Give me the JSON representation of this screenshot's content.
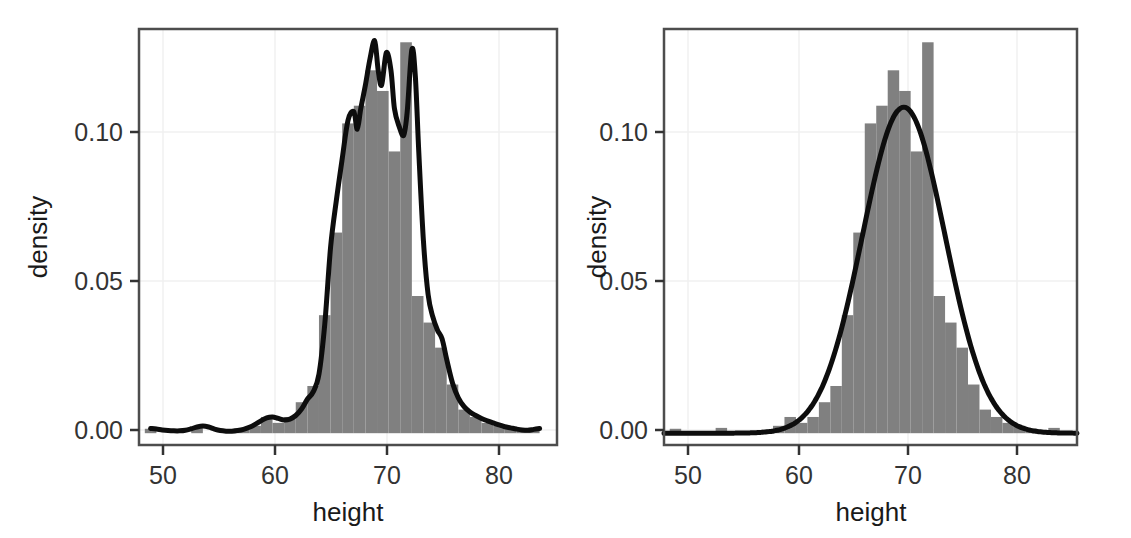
{
  "figure": {
    "panel_count": 2,
    "background": "#ffffff",
    "bar_color": "#808080",
    "curve_color": "#000000",
    "grid_color": "#f2f2f2",
    "border_color": "#4d4d4d",
    "text_color": "#1a1a1a"
  },
  "chart_data": [
    {
      "id": "left-panel",
      "type": "histogram-with-density",
      "title": "",
      "xlabel": "height",
      "ylabel": "density",
      "xlim": [
        48.5,
        84.5
      ],
      "ylim": [
        -0.004,
        0.137
      ],
      "xticks": [
        50,
        60,
        70,
        80
      ],
      "xticklabels": [
        "50",
        "60",
        "70",
        "80"
      ],
      "yticks": [
        0.0,
        0.05,
        0.1
      ],
      "yticklabels": [
        "0.00",
        "0.05",
        "0.10"
      ],
      "grid": true,
      "legend": "none",
      "annotation": "kernel density estimate overlaid on histogram; multimodal, bandwidth small",
      "bin_width": 1,
      "bins_x": [
        49.5,
        50.5,
        51.5,
        52.5,
        53.5,
        54.5,
        55.5,
        56.5,
        57.5,
        58.5,
        59.5,
        60.5,
        61.5,
        62.5,
        63.5,
        64.5,
        65.5,
        66.5,
        67.5,
        68.5,
        69.5,
        70.5,
        71.5,
        72.5,
        73.5,
        74.5,
        75.5,
        76.5,
        77.5,
        78.5,
        79.5,
        80.5,
        81.5,
        82.5
      ],
      "bin_values": [
        0.0015,
        0.0,
        0.0,
        0.0,
        0.0018,
        0.0,
        0.0,
        0.0,
        0.0012,
        0.0025,
        0.0055,
        0.0035,
        0.0055,
        0.0105,
        0.016,
        0.04,
        0.068,
        0.105,
        0.111,
        0.123,
        0.116,
        0.0955,
        0.1325,
        0.0465,
        0.0375,
        0.029,
        0.0165,
        0.008,
        0.0055,
        0.0035,
        0.0025,
        0.0015,
        0.001,
        0.0018
      ],
      "density_x": [
        49.5,
        50.0,
        50.5,
        51.0,
        51.5,
        52.0,
        52.5,
        53.0,
        53.5,
        54.0,
        54.5,
        55.0,
        55.5,
        56.0,
        56.5,
        57.0,
        57.5,
        58.0,
        58.5,
        59.0,
        59.5,
        60.0,
        60.5,
        61.0,
        61.5,
        62.0,
        62.5,
        63.0,
        63.5,
        64.0,
        64.5,
        65.0,
        65.5,
        66.0,
        66.5,
        67.0,
        67.3,
        67.6,
        68.0,
        68.4,
        68.8,
        69.1,
        69.4,
        69.8,
        70.2,
        70.5,
        70.9,
        71.3,
        71.6,
        72.0,
        72.3,
        72.6,
        73.0,
        73.4,
        73.8,
        74.2,
        74.6,
        75.0,
        75.5,
        76.0,
        76.5,
        77.0,
        77.5,
        78.0,
        78.5,
        79.0,
        79.5,
        80.0,
        80.5,
        81.0,
        81.5,
        82.0,
        82.5,
        83.0
      ],
      "density_y": [
        0.0016,
        0.0014,
        0.0011,
        0.0009,
        0.0008,
        0.0008,
        0.001,
        0.0015,
        0.0021,
        0.0024,
        0.0021,
        0.0014,
        0.0009,
        0.0007,
        0.0007,
        0.0009,
        0.0013,
        0.002,
        0.003,
        0.0042,
        0.0052,
        0.0055,
        0.005,
        0.0045,
        0.0048,
        0.006,
        0.0082,
        0.0115,
        0.014,
        0.02,
        0.037,
        0.063,
        0.079,
        0.093,
        0.106,
        0.109,
        0.103,
        0.11,
        0.118,
        0.127,
        0.133,
        0.123,
        0.118,
        0.129,
        0.123,
        0.11,
        0.104,
        0.101,
        0.109,
        0.13,
        0.121,
        0.095,
        0.065,
        0.047,
        0.0395,
        0.035,
        0.032,
        0.025,
        0.017,
        0.012,
        0.009,
        0.0072,
        0.006,
        0.005,
        0.0042,
        0.0035,
        0.0028,
        0.0022,
        0.0018,
        0.0014,
        0.0011,
        0.001,
        0.0013,
        0.0016
      ]
    },
    {
      "id": "right-panel",
      "type": "histogram-with-normal-fit",
      "title": "",
      "xlabel": "height",
      "ylabel": "density",
      "xlim": [
        48.5,
        84.5
      ],
      "ylim": [
        -0.004,
        0.137
      ],
      "xticks": [
        50,
        60,
        70,
        80
      ],
      "xticklabels": [
        "50",
        "60",
        "70",
        "80"
      ],
      "yticks": [
        0.0,
        0.05,
        0.1
      ],
      "yticklabels": [
        "0.00",
        "0.05",
        "0.10"
      ],
      "grid": true,
      "legend": "none",
      "annotation": "fitted normal density overlaid on histogram; unimodal smooth bell curve",
      "bin_width": 1,
      "bins_x": [
        49.5,
        50.5,
        51.5,
        52.5,
        53.5,
        54.5,
        55.5,
        56.5,
        57.5,
        58.5,
        59.5,
        60.5,
        61.5,
        62.5,
        63.5,
        64.5,
        65.5,
        66.5,
        67.5,
        68.5,
        69.5,
        70.5,
        71.5,
        72.5,
        73.5,
        74.5,
        75.5,
        76.5,
        77.5,
        78.5,
        79.5,
        80.5,
        81.5,
        82.5
      ],
      "bin_values": [
        0.0015,
        0.0,
        0.0,
        0.0,
        0.0018,
        0.0,
        0.0,
        0.0,
        0.0012,
        0.0025,
        0.0055,
        0.0035,
        0.0055,
        0.0105,
        0.016,
        0.04,
        0.068,
        0.105,
        0.111,
        0.123,
        0.116,
        0.0955,
        0.1325,
        0.0465,
        0.0375,
        0.029,
        0.0165,
        0.008,
        0.0055,
        0.0035,
        0.0025,
        0.0015,
        0.001,
        0.0018
      ],
      "normal_fit": {
        "mean": 69.4,
        "sd": 3.6,
        "peak": 0.1105
      }
    }
  ],
  "left_panel": {
    "xlabel": "height",
    "ylabel": "density",
    "xticklabels": [
      "50",
      "60",
      "70",
      "80"
    ],
    "yticklabels": [
      "0.00",
      "0.05",
      "0.10"
    ]
  },
  "right_panel": {
    "xlabel": "height",
    "ylabel": "density",
    "xticklabels": [
      "50",
      "60",
      "70",
      "80"
    ],
    "yticklabels": [
      "0.00",
      "0.05",
      "0.10"
    ]
  }
}
